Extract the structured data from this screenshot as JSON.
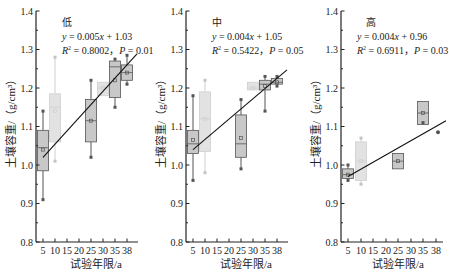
{
  "chart_data": [
    {
      "type": "box",
      "panel_label": "低",
      "equation": "y = 0.005x + 1.03",
      "stats": "R² = 0.8002，P = 0.01",
      "eq_y": "y",
      "eq_rest": " = 0.005",
      "eq_x": "x",
      "eq_tail": " + 1.03",
      "r2_label": "R",
      "r2_value": " = 0.8002，",
      "p_label": "P",
      "p_value": " = 0.01",
      "xlabel": "试验年限/a",
      "ylabel": "土壤容重/（g/cm³）",
      "categories": [
        "5",
        "10",
        "15",
        "20",
        "25",
        "30",
        "35",
        "38"
      ],
      "ylim": [
        0.8,
        1.4
      ],
      "yticks": [
        "0.8",
        "0.9",
        "1.0",
        "1.1",
        "1.2",
        "1.3",
        "1.4"
      ],
      "boxes": [
        {
          "x": "5",
          "shade": "dark",
          "min": 0.91,
          "q1": 0.985,
          "median": 1.045,
          "q3": 1.09,
          "max": 1.14,
          "mean": 1.04
        },
        {
          "x": "10",
          "shade": "light",
          "min": 1.01,
          "q1": 1.06,
          "median": 1.15,
          "q3": 1.185,
          "max": 1.28,
          "mean": 1.14
        },
        {
          "x": "25",
          "shade": "dark",
          "min": 1.02,
          "q1": 1.06,
          "median": 1.115,
          "q3": 1.17,
          "max": 1.22,
          "mean": 1.115
        },
        {
          "x": "30",
          "shade": "light",
          "min": 1.18,
          "q1": 1.18,
          "median": 1.2,
          "q3": 1.215,
          "max": 1.215,
          "mean": 1.2
        },
        {
          "x": "35",
          "shade": "dark",
          "min": 1.15,
          "q1": 1.175,
          "median": 1.255,
          "q3": 1.27,
          "max": 1.275,
          "mean": 1.22
        },
        {
          "x": "38",
          "shade": "dark",
          "min": 1.21,
          "q1": 1.22,
          "median": 1.24,
          "q3": 1.26,
          "max": 1.285,
          "mean": 1.24
        }
      ],
      "fit_line": {
        "x_from": "5",
        "y_from": 1.02,
        "x_to": "38",
        "y_to": 1.26
      }
    },
    {
      "type": "box",
      "panel_label": "中",
      "equation": "y = 0.004x + 1.05",
      "stats": "R² = 0.5422，P = 0.05",
      "eq_y": "y",
      "eq_rest": " = 0.004",
      "eq_x": "x",
      "eq_tail": " + 1.05",
      "r2_label": "R",
      "r2_value": " = 0.5422，",
      "p_label": "P",
      "p_value": " = 0.05",
      "xlabel": "试验年限/a",
      "ylabel": "土壤容重/（g/cm³）",
      "categories": [
        "5",
        "10",
        "15",
        "20",
        "25",
        "30",
        "35",
        "38"
      ],
      "ylim": [
        0.8,
        1.4
      ],
      "yticks": [
        "0.8",
        "0.9",
        "1.0",
        "1.1",
        "1.2",
        "1.3",
        "1.4"
      ],
      "boxes": [
        {
          "x": "5",
          "shade": "dark",
          "min": 0.96,
          "q1": 1.03,
          "median": 1.055,
          "q3": 1.09,
          "max": 1.18,
          "mean": 1.065
        },
        {
          "x": "10",
          "shade": "light",
          "min": 0.98,
          "q1": 1.035,
          "median": 1.12,
          "q3": 1.19,
          "max": 1.22,
          "mean": 1.12
        },
        {
          "x": "25",
          "shade": "dark",
          "min": 0.99,
          "q1": 1.02,
          "median": 1.055,
          "q3": 1.13,
          "max": 1.17,
          "mean": 1.07
        },
        {
          "x": "30",
          "shade": "light",
          "min": 1.195,
          "q1": 1.195,
          "median": 1.2,
          "q3": 1.215,
          "max": 1.215,
          "mean": 1.2
        },
        {
          "x": "35",
          "shade": "dark",
          "min": 1.14,
          "q1": 1.195,
          "median": 1.21,
          "q3": 1.22,
          "max": 1.23,
          "mean": 1.205
        },
        {
          "x": "38",
          "shade": "dark",
          "min": 1.205,
          "q1": 1.21,
          "median": 1.215,
          "q3": 1.225,
          "max": 1.23,
          "mean": 1.215
        }
      ],
      "fit_line": {
        "x_from": "5",
        "y_from": 1.04,
        "x_to": "38",
        "y_to": 1.225
      }
    },
    {
      "type": "box",
      "panel_label": "高",
      "equation": "y = 0.004x + 0.96",
      "stats": "R² = 0.6911，P = 0.03",
      "eq_y": "y",
      "eq_rest": " = 0.004",
      "eq_x": "x",
      "eq_tail": " + 0.96",
      "r2_label": "R",
      "r2_value": " = 0.6911，",
      "p_label": "P",
      "p_value": " = 0.03",
      "xlabel": "试验年限/a",
      "ylabel": "土壤容重/（g/cm³）",
      "categories": [
        "5",
        "10",
        "15",
        "20",
        "25",
        "30",
        "35",
        "38"
      ],
      "ylim": [
        0.8,
        1.4
      ],
      "yticks": [
        "0.8",
        "0.9",
        "1.0",
        "1.1",
        "1.2",
        "1.3",
        "1.4"
      ],
      "boxes": [
        {
          "x": "5",
          "shade": "dark",
          "min": 0.96,
          "q1": 0.965,
          "median": 0.975,
          "q3": 0.99,
          "max": 1.0,
          "mean": 0.975
        },
        {
          "x": "10",
          "shade": "light",
          "min": 0.95,
          "q1": 0.96,
          "median": 1.01,
          "q3": 1.06,
          "max": 1.07,
          "mean": 1.01
        },
        {
          "x": "25",
          "shade": "dark",
          "min": 0.99,
          "q1": 0.99,
          "median": 1.01,
          "q3": 1.03,
          "max": 1.03,
          "mean": 1.01
        },
        {
          "x": "35",
          "shade": "dark",
          "min": 1.11,
          "q1": 1.105,
          "median": 1.135,
          "q3": 1.165,
          "max": 1.165,
          "mean": 1.135
        },
        {
          "x": "38",
          "shade": "dark",
          "min": 1.085,
          "q1": 1.085,
          "median": 1.085,
          "q3": 1.085,
          "max": 1.085,
          "mean": 1.085
        }
      ],
      "fit_line": {
        "x_from": "5",
        "y_from": 0.97,
        "x_to": "38",
        "y_to": 1.1
      }
    }
  ],
  "layout": {
    "panels": [
      {
        "axis_x": 36,
        "x_end": 138,
        "tick_x": [
          43,
          55,
          67,
          79,
          91,
          103,
          115,
          127
        ]
      },
      {
        "axis_x": 186,
        "x_end": 288,
        "tick_x": [
          193,
          205,
          217,
          229,
          241,
          253,
          265,
          277
        ]
      },
      {
        "axis_x": 341,
        "x_end": 443,
        "tick_x": [
          348,
          361,
          373,
          386,
          398,
          411,
          423,
          436
        ]
      }
    ],
    "y_top_px": 11,
    "y_bottom_px": 242,
    "colors": {
      "dark_fill": "#c8c8c8",
      "dark_stroke": "#555555",
      "dark_point": "#555555",
      "light_fill": "#e2e2e2",
      "light_stroke": "#cfcfcf",
      "light_point": "#c4c4c4",
      "axis": "#222222",
      "fit_line": "#111111"
    }
  }
}
